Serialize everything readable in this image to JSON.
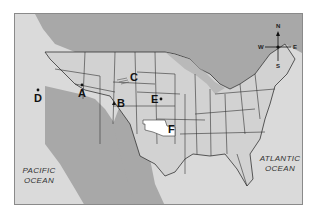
{
  "map": {
    "title": "United States map with lettered locations",
    "colors": {
      "land_us": "#d2d2d2",
      "land_other": "#a9a9a9",
      "water": "#dcdcdc",
      "border": "#333333",
      "highlight_state": "#ffffff"
    },
    "markers": [
      {
        "label": "A",
        "symbol": "dot",
        "region": "Utah/Nevada"
      },
      {
        "label": "B",
        "symbol": "triangle",
        "region": "Colorado"
      },
      {
        "label": "C",
        "symbol": "river",
        "region": "South Dakota"
      },
      {
        "label": "D",
        "symbol": "dot",
        "region": "California"
      },
      {
        "label": "E",
        "symbol": "dot",
        "region": "Iowa/Nebraska border"
      },
      {
        "label": "F",
        "symbol": "highlighted-state",
        "region": "Oklahoma"
      }
    ],
    "oceans": {
      "pacific_line1": "PACIFIC",
      "pacific_line2": "OCEAN",
      "atlantic_line1": "ATLANTIC",
      "atlantic_line2": "OCEAN"
    },
    "compass": {
      "n": "N",
      "s": "S",
      "e": "E",
      "w": "W"
    }
  }
}
